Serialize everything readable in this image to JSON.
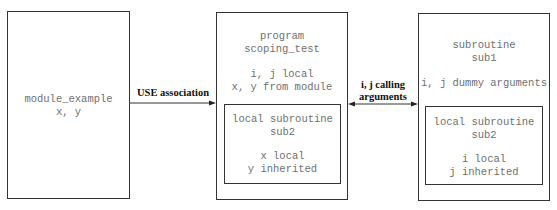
{
  "diagram": {
    "module_box": {
      "lines": [
        "module_example",
        "x, y"
      ]
    },
    "program_box": {
      "title_lines": [
        "program",
        "scoping_test"
      ],
      "var_lines": [
        "i, j local",
        "x, y from module"
      ],
      "inner": {
        "title_lines": [
          "local subroutine",
          "sub2"
        ],
        "var_lines": [
          "x local",
          "y inherited"
        ]
      }
    },
    "subroutine_box": {
      "title_lines": [
        "subroutine",
        "sub1"
      ],
      "var_lines": [
        "i, j dummy arguments"
      ],
      "inner": {
        "title_lines": [
          "local subroutine",
          "sub2"
        ],
        "var_lines": [
          "i local",
          "j inherited"
        ]
      }
    },
    "arrows": [
      {
        "label": "USE association",
        "from": "module_box",
        "to": "program_box",
        "direction": "single"
      },
      {
        "label_lines": [
          "i, j calling",
          "arguments"
        ],
        "from": "program_box",
        "to": "subroutine_box",
        "direction": "double"
      }
    ]
  }
}
